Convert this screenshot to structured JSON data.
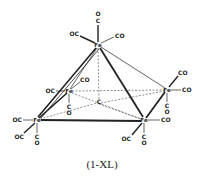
{
  "diagram": {
    "title": "(1-XL)",
    "atom_color": "#222222",
    "atoms": [
      {
        "id": "fe_apex",
        "label": "Fe",
        "x": 98,
        "y": 45
      },
      {
        "id": "fe_back_left",
        "label": "Fe",
        "x": 69,
        "y": 91
      },
      {
        "id": "fe_back_right",
        "label": "Fe",
        "x": 167,
        "y": 90
      },
      {
        "id": "fe_front_left",
        "label": "Fe",
        "x": 37,
        "y": 120
      },
      {
        "id": "fe_front_right",
        "label": "Fe",
        "x": 144,
        "y": 120
      },
      {
        "id": "c_center",
        "label": "C",
        "x": 99,
        "y": 102
      }
    ],
    "ligand_labels": {
      "apex_top_o": "O",
      "apex_top_c": "C",
      "apex_left": "OC",
      "apex_right": "CO",
      "back_left_left": "OC",
      "back_left_up": "CO",
      "back_left_down_c": "C",
      "back_left_down_o": "O",
      "back_right_up": "CO",
      "back_right_right": "CO",
      "back_right_down_c": "C",
      "back_right_down_o": "O",
      "front_left_left": "OC",
      "front_left_diag": "OC",
      "front_left_down_c": "C",
      "front_left_down_o": "O",
      "front_right_right": "CO",
      "front_right_diag": "OC",
      "front_right_down_c": "C",
      "front_right_down_o": "O"
    },
    "caption": "(1-XL)"
  }
}
